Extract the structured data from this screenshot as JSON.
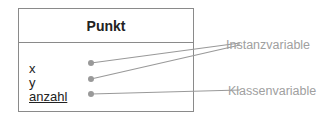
{
  "class_box": {
    "name": "Punkt",
    "attributes": [
      {
        "name": "x",
        "static": false
      },
      {
        "name": "y",
        "static": false
      },
      {
        "name": "anzahl",
        "static": true
      }
    ]
  },
  "annotations": {
    "instance": "Instanzvariable",
    "class": "Klassenvariable"
  },
  "colors": {
    "border": "#8a8a8a",
    "connector": "#999999",
    "annotation_text": "#a0a0a0"
  }
}
